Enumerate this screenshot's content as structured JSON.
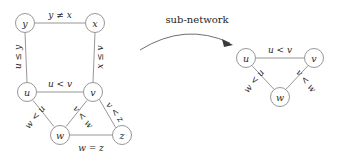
{
  "figure": {
    "background_color": "#ffffff",
    "stroke_color": "#8b8b8b",
    "text_color": "#2b2b2b"
  },
  "annotation": {
    "arrow_caption": "sub-network",
    "arrow_icon_name": "curved-arrow-icon"
  },
  "main_network": {
    "nodes": [
      {
        "id": "y",
        "label": "y",
        "cx": 25,
        "cy": 23,
        "r": 9.5
      },
      {
        "id": "x",
        "label": "x",
        "cx": 95,
        "cy": 23,
        "r": 9.5
      },
      {
        "id": "u",
        "label": "u",
        "cx": 27,
        "cy": 92,
        "r": 9.5
      },
      {
        "id": "v",
        "label": "v",
        "cx": 93,
        "cy": 92,
        "r": 9.5
      },
      {
        "id": "w",
        "label": "w",
        "cx": 60,
        "cy": 135,
        "r": 9.5
      },
      {
        "id": "z",
        "label": "z",
        "cx": 122,
        "cy": 135,
        "r": 9.5
      }
    ],
    "edges": [
      {
        "id": "y-x",
        "from": "y",
        "to": "x",
        "label": "y ≠ x",
        "label_x": 60,
        "label_y": 15,
        "rotation": 0
      },
      {
        "id": "y-u",
        "from": "y",
        "to": "u",
        "label": "u ≤ y",
        "label_x": 18,
        "label_y": 57,
        "rotation": -90
      },
      {
        "id": "x-v",
        "from": "x",
        "to": "v",
        "label": "x ≤ v",
        "label_x": 100,
        "label_y": 57,
        "rotation": -90
      },
      {
        "id": "u-v",
        "from": "u",
        "to": "v",
        "label": "u < v",
        "label_x": 60,
        "label_y": 84,
        "rotation": 0
      },
      {
        "id": "u-w",
        "from": "u",
        "to": "w",
        "label": "w < u",
        "label_x": 35,
        "label_y": 117,
        "rotation": -52
      },
      {
        "id": "v-w",
        "from": "v",
        "to": "w",
        "label": "v < w",
        "label_x": 83,
        "label_y": 117,
        "rotation": 52
      },
      {
        "id": "v-z",
        "from": "v",
        "to": "z",
        "label": "v < z",
        "label_x": 115,
        "label_y": 112,
        "rotation": 52
      },
      {
        "id": "w-z",
        "from": "w",
        "to": "z",
        "label": "w = z",
        "label_x": 91,
        "label_y": 148,
        "rotation": 0
      }
    ]
  },
  "sub_network": {
    "nodes": [
      {
        "id": "u2",
        "label": "u",
        "cx": 246,
        "cy": 58,
        "r": 9.5
      },
      {
        "id": "v2",
        "label": "v",
        "cx": 314,
        "cy": 58,
        "r": 9.5
      },
      {
        "id": "w2",
        "label": "w",
        "cx": 280,
        "cy": 97,
        "r": 9.5
      }
    ],
    "edges": [
      {
        "id": "u2-v2",
        "from": "u2",
        "to": "v2",
        "label": "u < v",
        "label_x": 280,
        "label_y": 50,
        "rotation": 0
      },
      {
        "id": "u2-w2",
        "from": "u2",
        "to": "w2",
        "label": "w < u",
        "label_x": 254,
        "label_y": 81,
        "rotation": -52
      },
      {
        "id": "v2-w2",
        "from": "v2",
        "to": "w2",
        "label": "v < w",
        "label_x": 306,
        "label_y": 81,
        "rotation": 52
      }
    ]
  }
}
